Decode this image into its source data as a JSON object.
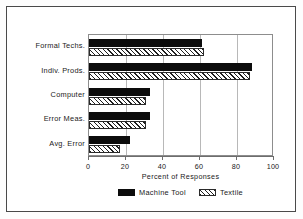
{
  "chart_data": {
    "type": "bar",
    "orientation": "horizontal",
    "title": "",
    "xlabel": "Percent of Responses",
    "ylabel": "",
    "xlim": [
      0,
      100
    ],
    "xticks": [
      0,
      20,
      40,
      60,
      80,
      100
    ],
    "xticklabels": [
      "0",
      "20",
      "40",
      "60",
      "80",
      "100"
    ],
    "grid": true,
    "grid_axis": "x",
    "legend_position": "bottom-center",
    "categories": [
      "Formal Techs.",
      "Indiv. Prods.",
      "Computer",
      "Error Meas.",
      "Avg. Error"
    ],
    "series": [
      {
        "name": "Machine Tool",
        "fill": "solid-black",
        "color": "#0c0c0c",
        "values": [
          61,
          88,
          33,
          33,
          22
        ]
      },
      {
        "name": "Textile",
        "fill": "diagonal-hatch",
        "color": "#ffffff",
        "hatch_color": "#1f1f1f",
        "values": [
          62,
          87,
          31,
          31,
          17
        ]
      }
    ]
  },
  "legend": {
    "entries": [
      {
        "label": "Machine Tool",
        "swatch": "solid-black-swatch"
      },
      {
        "label": "Textile",
        "swatch": "hatched-swatch"
      }
    ]
  },
  "colors": {
    "frame": "#4a4a4a",
    "axis": "#6d6d6d",
    "gridline": "#b8b8b8",
    "text": "#1a1a1a",
    "background": "#ffffff"
  }
}
